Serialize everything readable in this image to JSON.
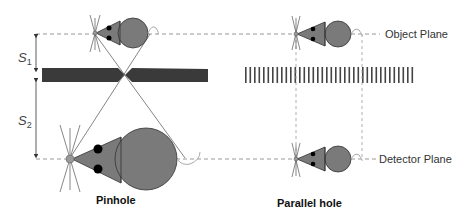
{
  "diagram": {
    "labels": {
      "object_plane": "Object Plane",
      "detector_plane": "Detector Plane",
      "pinhole": "Pinhole",
      "parallel_hole": "Parallel hole",
      "s1": "S",
      "s1_sub": "1",
      "s2": "S",
      "s2_sub": "2"
    },
    "colors": {
      "mouse_body": "#7a7a7a",
      "mouse_outline": "#333333",
      "collimator": "#3a3a3a",
      "dashed_line": "#999999",
      "ray": "#666666",
      "tail": "#aaaaaa"
    }
  }
}
